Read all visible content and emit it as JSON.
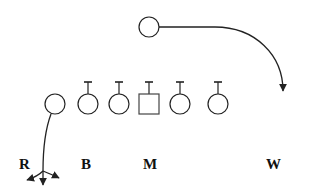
{
  "diagram": {
    "type": "football-play",
    "colors": {
      "stroke": "#222222",
      "background": "#ffffff",
      "label": "#111111"
    },
    "players": [
      {
        "id": "motion-player",
        "shape": "circle",
        "x": 149,
        "y": 27,
        "block": false
      },
      {
        "id": "lineman-1",
        "shape": "circle",
        "x": 55,
        "y": 104,
        "block": false
      },
      {
        "id": "lineman-2",
        "shape": "circle",
        "x": 88,
        "y": 104,
        "block": true
      },
      {
        "id": "lineman-3",
        "shape": "circle",
        "x": 119,
        "y": 104,
        "block": true
      },
      {
        "id": "center",
        "shape": "square",
        "x": 149,
        "y": 104,
        "block": true
      },
      {
        "id": "lineman-5",
        "shape": "circle",
        "x": 180,
        "y": 104,
        "block": true
      },
      {
        "id": "lineman-6",
        "shape": "circle",
        "x": 218,
        "y": 104,
        "block": true
      }
    ],
    "labels": [
      {
        "id": "R",
        "text": "R",
        "x": 19,
        "y": 157
      },
      {
        "id": "B",
        "text": "B",
        "x": 81,
        "y": 157
      },
      {
        "id": "M",
        "text": "M",
        "x": 143,
        "y": 157
      },
      {
        "id": "W",
        "text": "W",
        "x": 266,
        "y": 157
      }
    ],
    "routes": [
      {
        "id": "motion-route",
        "description": "curved route from top circle sweeping right and down",
        "end_arrow": true
      },
      {
        "id": "option-route",
        "description": "route from lineman-1 down to a three-way fork with arrows",
        "branches": 3
      }
    ]
  }
}
